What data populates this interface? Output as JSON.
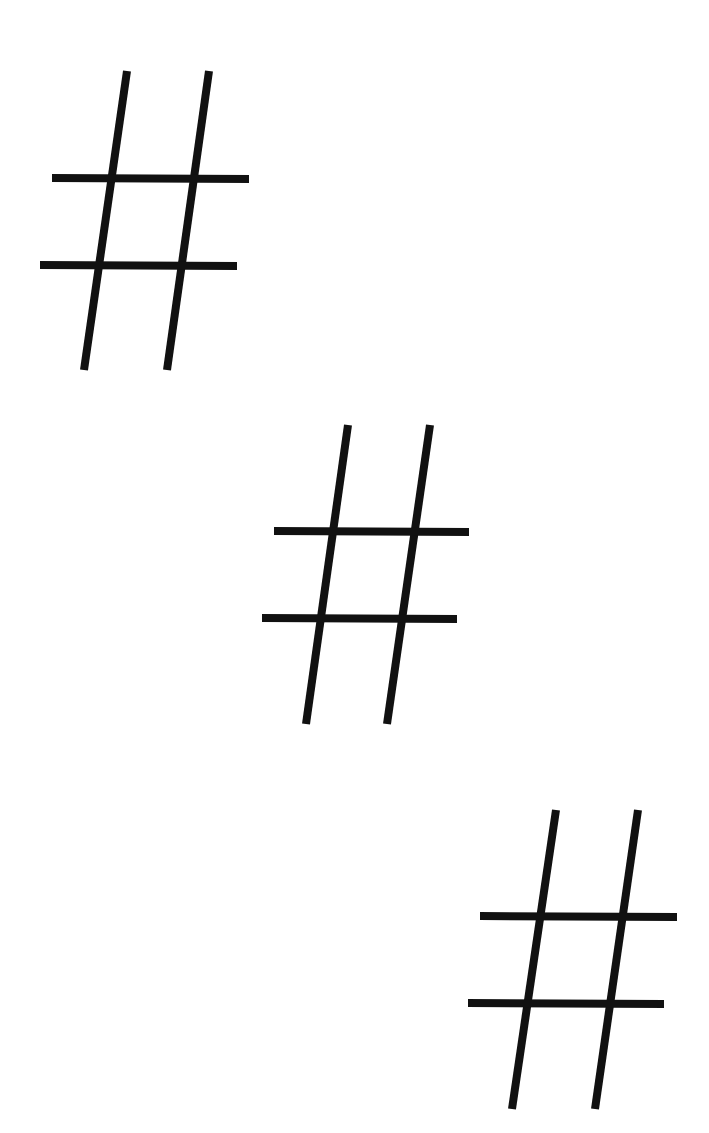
{
  "canvas": {
    "width": 709,
    "height": 1133,
    "background": "#ffffff",
    "stroke_color": "#111111",
    "stroke_width": 8
  },
  "symbols": [
    {
      "name": "hash-symbol-1",
      "glyph": "#",
      "lines": [
        {
          "role": "left-vertical",
          "x1": 127,
          "y1": 71,
          "x2": 84,
          "y2": 370
        },
        {
          "role": "right-vertical",
          "x1": 209,
          "y1": 71,
          "x2": 167,
          "y2": 370
        },
        {
          "role": "top-horizontal",
          "x1": 52,
          "y1": 178,
          "x2": 249,
          "y2": 179
        },
        {
          "role": "bottom-horizontal",
          "x1": 40,
          "y1": 265,
          "x2": 237,
          "y2": 266
        }
      ]
    },
    {
      "name": "hash-symbol-2",
      "glyph": "#",
      "lines": [
        {
          "role": "left-vertical",
          "x1": 348,
          "y1": 425,
          "x2": 306,
          "y2": 724
        },
        {
          "role": "right-vertical",
          "x1": 430,
          "y1": 425,
          "x2": 387,
          "y2": 724
        },
        {
          "role": "top-horizontal",
          "x1": 274,
          "y1": 531,
          "x2": 469,
          "y2": 532
        },
        {
          "role": "bottom-horizontal",
          "x1": 262,
          "y1": 618,
          "x2": 457,
          "y2": 619
        }
      ]
    },
    {
      "name": "hash-symbol-3",
      "glyph": "#",
      "lines": [
        {
          "role": "left-vertical",
          "x1": 556,
          "y1": 810,
          "x2": 512,
          "y2": 1109
        },
        {
          "role": "right-vertical",
          "x1": 638,
          "y1": 810,
          "x2": 595,
          "y2": 1109
        },
        {
          "role": "top-horizontal",
          "x1": 480,
          "y1": 916,
          "x2": 677,
          "y2": 917
        },
        {
          "role": "bottom-horizontal",
          "x1": 468,
          "y1": 1003,
          "x2": 664,
          "y2": 1004
        }
      ]
    }
  ]
}
